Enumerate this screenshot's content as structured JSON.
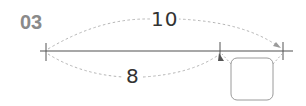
{
  "problem": {
    "number": "03"
  },
  "diagram": {
    "total_length_label": "10",
    "segment_length_label": "8",
    "unknown_box_value": "",
    "colors": {
      "line": "#8a8a8a",
      "tick": "#555555",
      "dashed": "#b5b5b5",
      "box_border": "#9a9a9a",
      "text": "#333333",
      "problem_number": "#8a8a8a"
    }
  }
}
